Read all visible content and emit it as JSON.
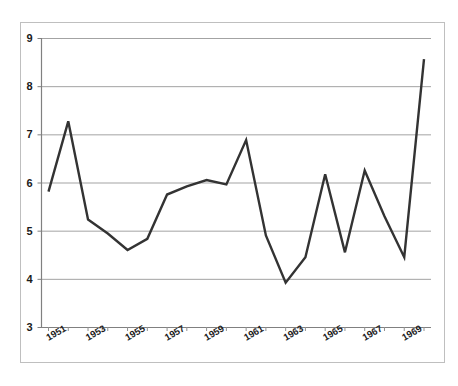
{
  "figure": {
    "background_color": "#ffffff",
    "border_color": "#b3b3b3",
    "plot_area_border_color": "#808080"
  },
  "chart_data": {
    "type": "line",
    "title": "",
    "subtitle": "",
    "xlabel": "",
    "ylabel": "",
    "x": [
      1951,
      1952,
      1953,
      1954,
      1955,
      1956,
      1957,
      1958,
      1959,
      1960,
      1961,
      1962,
      1963,
      1964,
      1965,
      1966,
      1967,
      1968,
      1969,
      1970
    ],
    "values": [
      5.81,
      7.27,
      5.23,
      4.94,
      4.6,
      4.83,
      5.75,
      5.92,
      6.05,
      5.96,
      6.88,
      4.9,
      3.92,
      4.45,
      6.17,
      4.55,
      6.25,
      5.3,
      4.45,
      8.56
    ],
    "series": [
      {
        "name": "series-1",
        "color": "#333333",
        "line_width": 2.4,
        "values": [
          5.81,
          7.27,
          5.23,
          4.94,
          4.6,
          4.83,
          5.75,
          5.92,
          6.05,
          5.96,
          6.88,
          4.9,
          3.92,
          4.45,
          6.17,
          4.55,
          6.25,
          5.3,
          4.45,
          8.56
        ]
      }
    ],
    "ylim": [
      3,
      9
    ],
    "y_ticks": [
      3,
      4,
      5,
      6,
      7,
      8,
      9
    ],
    "y_tick_labels": [
      "3",
      "4",
      "5",
      "6",
      "7",
      "8",
      "9"
    ],
    "x_tick_labels": [
      "1951",
      "",
      "1953",
      "",
      "1955",
      "",
      "1957",
      "",
      "1959",
      "",
      "1961",
      "",
      "1963",
      "",
      "1965",
      "",
      "1967",
      "",
      "1969",
      ""
    ],
    "x_tick_labels_visible": [
      "1951",
      "1953",
      "1955",
      "1957",
      "1959",
      "1961",
      "1963",
      "1965",
      "1967",
      "1969"
    ],
    "grid": {
      "horizontal": true,
      "vertical": false,
      "color": "#999999"
    },
    "legend": {
      "visible": false,
      "position": "none"
    },
    "x_tick_label_rotation": -30,
    "markers": false
  }
}
